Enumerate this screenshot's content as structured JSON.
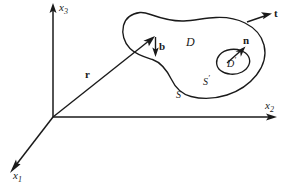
{
  "figure": {
    "background_color": "#ffffff",
    "ink_color": "#1a1a1a",
    "axes": {
      "x1": {
        "label": "x",
        "subscript": "1",
        "direction": "down-left"
      },
      "x2": {
        "label": "x",
        "subscript": "2",
        "direction": "right"
      },
      "x3": {
        "label": "x",
        "subscript": "3",
        "direction": "up"
      }
    },
    "vectors": {
      "r": {
        "label": "r",
        "description": "position vector from origin to surface point"
      },
      "b": {
        "label": "b",
        "description": "binormal unit vector at boundary point"
      },
      "t": {
        "label": "t",
        "description": "tangent unit vector along boundary curve"
      },
      "n": {
        "label": "n",
        "description": "normal unit vector on inner patch"
      }
    },
    "regions": {
      "D": {
        "label": "D",
        "description": "outer surface region"
      },
      "D_prime": {
        "label": "D",
        "prime": "′",
        "description": "inner surface region"
      },
      "S": {
        "label": "S",
        "description": "outer boundary curve"
      },
      "S_prime": {
        "label": "S",
        "prime": "′",
        "description": "inner boundary curve"
      }
    }
  }
}
